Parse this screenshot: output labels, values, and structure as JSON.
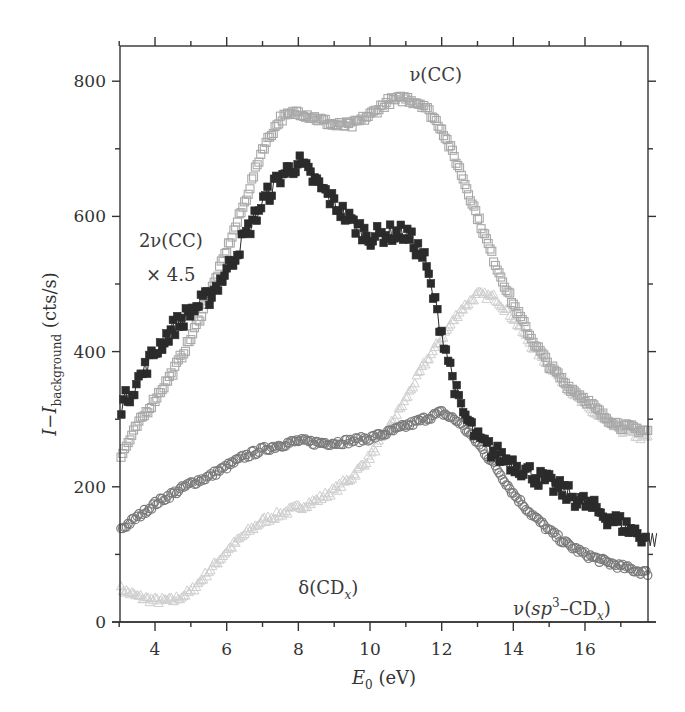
{
  "chart_data": {
    "type": "scatter",
    "title": "",
    "xlabel": "E0 (eV)",
    "xlabel_parts": {
      "main": "E",
      "sub": "0",
      "unit": " (eV)"
    },
    "ylabel": "I−I_background (cts/s)",
    "ylabel_parts": {
      "main": "I−I",
      "sub": "background",
      "unit": " (cts/s)"
    },
    "xlim": [
      3,
      18
    ],
    "ylim": [
      0,
      850
    ],
    "x_ticks": [
      4,
      6,
      8,
      10,
      12,
      14,
      16
    ],
    "x_tick_labels": [
      "4",
      "6",
      "8",
      "10",
      "12",
      "14",
      "16"
    ],
    "x_minor_ticks": [
      3,
      5,
      7,
      9,
      11,
      13,
      15,
      17
    ],
    "y_ticks": [
      0,
      200,
      400,
      600,
      800
    ],
    "y_tick_labels": [
      "0",
      "200",
      "400",
      "600",
      "800"
    ],
    "y_minor_ticks": [
      100,
      300,
      500,
      700
    ],
    "grid": false,
    "legend": "none (inline annotations)",
    "annotations": [
      {
        "id": "nu-cc",
        "text": "ν(CC)",
        "x": 11.1,
        "y": 800
      },
      {
        "id": "two-nu-cc",
        "text": "2ν(CC)",
        "x": 3.55,
        "y": 555
      },
      {
        "id": "scale-factor",
        "text": "× 4.5",
        "x": 3.75,
        "y": 505
      },
      {
        "id": "delta-cdx",
        "text": "δ(CD",
        "sub": "x",
        "close": ")",
        "x": 8.0,
        "y": 42
      },
      {
        "id": "nu-sp3-cdx",
        "text": "ν(sp",
        "sup": "3",
        "mid": "–CD",
        "sub": "x",
        "close": ")",
        "x": 14.0,
        "y": 10
      }
    ],
    "series": [
      {
        "name": "ν(CC)",
        "marker": "open-square",
        "color": "#a8a8a8",
        "x": [
          3.0,
          3.5,
          4.0,
          4.5,
          5.0,
          5.5,
          6.0,
          6.5,
          7.0,
          7.5,
          8.0,
          8.5,
          9.0,
          9.5,
          10.0,
          10.5,
          11.0,
          11.5,
          12.0,
          12.5,
          13.0,
          13.5,
          14.0,
          14.5,
          15.0,
          15.5,
          16.0,
          16.5,
          17.0,
          17.5,
          18.0
        ],
        "y": [
          240,
          290,
          330,
          370,
          420,
          480,
          550,
          620,
          700,
          745,
          755,
          745,
          735,
          735,
          750,
          770,
          775,
          765,
          730,
          670,
          600,
          530,
          470,
          420,
          380,
          350,
          330,
          305,
          290,
          285,
          280
        ]
      },
      {
        "name": "2ν(CC) × 4.5",
        "marker": "filled-square",
        "color": "#2b2b2b",
        "x": [
          3.0,
          3.5,
          4.0,
          4.5,
          5.0,
          5.5,
          6.0,
          6.5,
          7.0,
          7.5,
          8.0,
          8.5,
          9.0,
          9.5,
          10.0,
          10.5,
          11.0,
          11.5,
          12.0,
          12.5,
          13.0,
          13.5,
          14.0,
          14.5,
          15.0,
          15.5,
          16.0,
          16.5,
          17.0,
          17.5,
          18.0
        ],
        "y": [
          315,
          355,
          400,
          435,
          460,
          480,
          520,
          570,
          620,
          660,
          680,
          650,
          620,
          590,
          570,
          575,
          575,
          540,
          430,
          320,
          270,
          250,
          235,
          220,
          205,
          190,
          175,
          160,
          145,
          130,
          120
        ]
      },
      {
        "name": "δ(CDx)",
        "marker": "open-circle",
        "color": "#7a7a7a",
        "x": [
          3.0,
          3.5,
          4.0,
          4.5,
          5.0,
          5.5,
          6.0,
          6.5,
          7.0,
          7.5,
          8.0,
          8.5,
          9.0,
          9.5,
          10.0,
          10.5,
          11.0,
          11.5,
          12.0,
          12.5,
          13.0,
          13.5,
          14.0,
          14.5,
          15.0,
          15.5,
          16.0,
          16.5,
          17.0,
          17.5,
          18.0
        ],
        "y": [
          135,
          155,
          175,
          190,
          205,
          215,
          230,
          245,
          255,
          262,
          268,
          265,
          265,
          268,
          272,
          280,
          290,
          300,
          310,
          295,
          265,
          230,
          190,
          160,
          135,
          115,
          100,
          90,
          82,
          75,
          70
        ]
      },
      {
        "name": "ν(sp3–CDx)",
        "marker": "open-triangle",
        "color": "#cfcfcf",
        "x": [
          3.0,
          3.5,
          4.0,
          4.5,
          5.0,
          5.5,
          6.0,
          6.5,
          7.0,
          7.5,
          8.0,
          8.5,
          9.0,
          9.5,
          10.0,
          10.5,
          11.0,
          11.5,
          12.0,
          12.5,
          13.0,
          13.5,
          14.0,
          14.5,
          15.0,
          15.5,
          16.0,
          16.5,
          17.0,
          17.5,
          18.0
        ],
        "y": [
          50,
          38,
          32,
          32,
          45,
          75,
          105,
          130,
          150,
          160,
          170,
          180,
          195,
          215,
          245,
          285,
          330,
          380,
          420,
          460,
          485,
          480,
          450,
          410,
          380,
          350,
          320,
          300,
          285,
          275,
          270
        ]
      }
    ]
  },
  "plot_frame": {
    "left_px": 120,
    "right_px": 648,
    "top_px": 46,
    "bottom_px": 622,
    "x_origin_px": 119.2,
    "x_px_per_unit": 35.83,
    "y_origin_px": 622,
    "y_px_per_unit": 0.676
  }
}
